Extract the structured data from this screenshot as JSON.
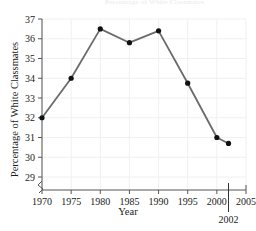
{
  "figure": {
    "faded_header": "Percentage of White Classmates",
    "background": "#ffffff",
    "line_color": "#6b6b6b",
    "marker_color": "#111111",
    "grid_color": "#f0f0f0",
    "axis_color": "#555555"
  },
  "chart_data": {
    "type": "line",
    "title": "",
    "xlabel": "Year",
    "ylabel": "Percentage of White Classmates",
    "x": [
      1970,
      1975,
      1980,
      1985,
      1990,
      1995,
      2000,
      2002
    ],
    "values": [
      32.0,
      34.0,
      36.5,
      35.8,
      36.4,
      33.75,
      31.0,
      30.7
    ],
    "series": [
      {
        "name": "Percentage of White Classmates",
        "values": [
          32.0,
          34.0,
          36.5,
          35.8,
          36.4,
          33.75,
          31.0,
          30.7
        ]
      }
    ],
    "xlim": [
      1970,
      2005
    ],
    "ylim": [
      28.6,
      37
    ],
    "xticks": [
      1970,
      1975,
      1980,
      1985,
      1990,
      1995,
      2000,
      2005
    ],
    "xtick_labels": [
      "1970",
      "1975",
      "1980",
      "1985",
      "1990",
      "1995",
      "2000",
      "2005"
    ],
    "yticks": [
      29,
      30,
      31,
      32,
      33,
      34,
      35,
      36,
      37
    ],
    "ytick_labels": [
      "29",
      "30",
      "31",
      "32",
      "33",
      "34",
      "35",
      "36",
      "37"
    ],
    "grid": true,
    "legend": "none",
    "axis_break": "y-axis break below 29",
    "annotations": [
      {
        "label": "2002",
        "x": 2002,
        "type": "vertical-reference-line"
      }
    ]
  }
}
